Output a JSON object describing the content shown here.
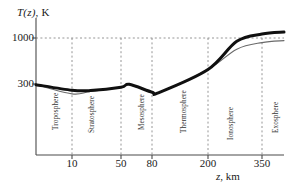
{
  "chart_data": {
    "type": "line",
    "title": "",
    "ylabel": "T(z), K",
    "xlabel": "z, km",
    "grid": true,
    "legend": "none",
    "y_ticks": [
      {
        "label": "1000",
        "value": 1000
      },
      {
        "label": "300",
        "value": 300
      }
    ],
    "x_ticks": [
      {
        "label": "10",
        "value": 10
      },
      {
        "label": "50",
        "value": 50
      },
      {
        "label": "80",
        "value": 80
      },
      {
        "label": "200",
        "value": 200
      },
      {
        "label": "350",
        "value": 350
      }
    ],
    "annotations": [
      {
        "label": "Troposphere",
        "x": 5
      },
      {
        "label": "Stratosphere",
        "x": 30
      },
      {
        "label": "Mesosphere",
        "x": 65
      },
      {
        "label": "Thermosphere",
        "x": 140
      },
      {
        "label": "Ionosphere",
        "x": 275
      },
      {
        "label": "Exosphere",
        "x": 420
      }
    ],
    "boundaries": [
      10,
      50,
      80,
      200,
      350
    ],
    "series": [
      {
        "name": "thick-profile",
        "color": "#101010",
        "width": 3.0,
        "points": [
          {
            "x": 0,
            "y": 290
          },
          {
            "x": 10,
            "y": 205
          },
          {
            "x": 25,
            "y": 200
          },
          {
            "x": 50,
            "y": 250
          },
          {
            "x": 58,
            "y": 295
          },
          {
            "x": 80,
            "y": 175
          },
          {
            "x": 95,
            "y": 170
          },
          {
            "x": 200,
            "y": 520
          },
          {
            "x": 280,
            "y": 950
          },
          {
            "x": 350,
            "y": 1060
          },
          {
            "x": 440,
            "y": 1090
          }
        ]
      },
      {
        "name": "thin-profile",
        "color": "#6a6a6a",
        "width": 1.1,
        "points": [
          {
            "x": 0,
            "y": 290
          },
          {
            "x": 10,
            "y": 150
          },
          {
            "x": 25,
            "y": 185
          },
          {
            "x": 50,
            "y": 250
          },
          {
            "x": 58,
            "y": 290
          },
          {
            "x": 80,
            "y": 172
          },
          {
            "x": 95,
            "y": 168
          },
          {
            "x": 200,
            "y": 520
          },
          {
            "x": 280,
            "y": 830
          },
          {
            "x": 350,
            "y": 930
          },
          {
            "x": 440,
            "y": 960
          }
        ]
      }
    ],
    "axis_colors": {
      "axis": "#4a4a4a",
      "grid": "#8a8a8a"
    }
  }
}
